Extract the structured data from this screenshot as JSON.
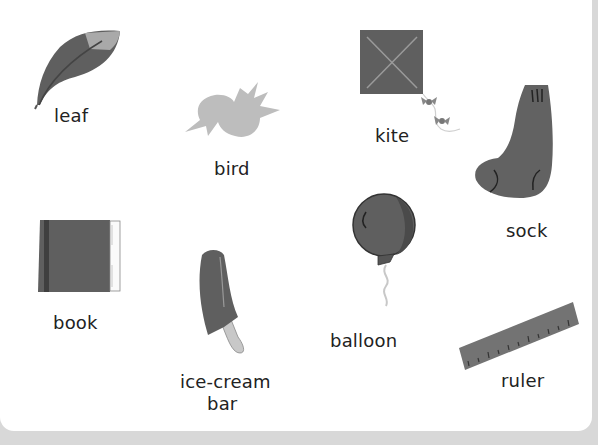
{
  "worksheet": {
    "items": [
      {
        "id": "leaf",
        "label": "leaf"
      },
      {
        "id": "bird",
        "label": "bird"
      },
      {
        "id": "kite",
        "label": "kite"
      },
      {
        "id": "sock",
        "label": "sock"
      },
      {
        "id": "book",
        "label": "book"
      },
      {
        "id": "ice-cream-bar",
        "label_line1": "ice-cream",
        "label_line2": "bar"
      },
      {
        "id": "balloon",
        "label": "balloon"
      },
      {
        "id": "ruler",
        "label": "ruler"
      }
    ]
  },
  "colors": {
    "background": "#ffffff",
    "footer": "#d8d8d8",
    "dark_fill": "#5f5f5f",
    "light_fill": "#b8b8b8",
    "text": "#222222"
  }
}
